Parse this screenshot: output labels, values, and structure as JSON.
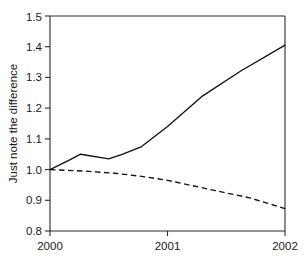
{
  "chart_data": {
    "type": "line",
    "title": "",
    "xlabel": "",
    "ylabel": "Just note the difference",
    "xlim": [
      2000,
      2002
    ],
    "ylim": [
      0.8,
      1.5
    ],
    "grid": false,
    "legend": "none",
    "x_ticks": [
      "2000",
      "2001",
      "2002"
    ],
    "x_tick_values": [
      2000,
      2001,
      2002
    ],
    "y_ticks": [
      "0.8",
      "0.9",
      "1.0",
      "1.1",
      "1.2",
      "1.3",
      "1.4",
      "1.5"
    ],
    "y_tick_values": [
      0.8,
      0.9,
      1.0,
      1.1,
      1.2,
      1.3,
      1.4,
      1.5
    ],
    "series": [
      {
        "name": "solid-series",
        "style": "solid",
        "color": "#111111",
        "x": [
          2000.0,
          2000.16,
          2000.26,
          2000.5,
          2000.62,
          2000.78,
          2001.0,
          2001.3,
          2001.62,
          2002.0
        ],
        "values": [
          1.0,
          1.03,
          1.05,
          1.035,
          1.05,
          1.075,
          1.14,
          1.24,
          1.32,
          1.405
        ]
      },
      {
        "name": "dashed-series",
        "style": "dashed",
        "color": "#111111",
        "x": [
          2000.0,
          2000.3,
          2000.55,
          2000.78,
          2001.0,
          2001.4,
          2001.7,
          2002.0
        ],
        "values": [
          1.0,
          0.995,
          0.988,
          0.978,
          0.965,
          0.932,
          0.908,
          0.873
        ]
      }
    ]
  },
  "axis": {
    "y_title": "Just note the difference"
  }
}
